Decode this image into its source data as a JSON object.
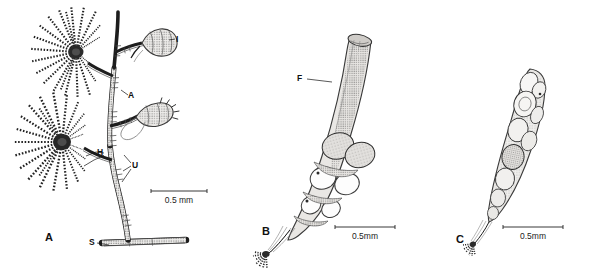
{
  "figure": {
    "background_color": "#ffffff",
    "ink_color": "#1d1d1d"
  },
  "panels": [
    {
      "id": "A",
      "letter": "A",
      "subject": "whole hydroid colony with hydranths, gonothecae and stolon",
      "labels": [
        {
          "key": "I",
          "text": "I",
          "meaning": "upper gonotheca"
        },
        {
          "key": "A",
          "text": "A",
          "meaning": "annulated pedicel"
        },
        {
          "key": "H",
          "text": "H",
          "meaning": "hydranth"
        },
        {
          "key": "U",
          "text": "U",
          "meaning": "hydrotheca / cup"
        },
        {
          "key": "S",
          "text": "S",
          "meaning": "stolon"
        }
      ],
      "scalebar": {
        "text": "0.5 mm"
      }
    },
    {
      "id": "B",
      "letter": "B",
      "subject": "gonotheca containing gonophores",
      "labels": [
        {
          "key": "F",
          "text": "F",
          "meaning": "gonotheca wall"
        }
      ],
      "scalebar": {
        "text": "0.5mm"
      }
    },
    {
      "id": "C",
      "letter": "C",
      "subject": "slender gonotheca with developing gonophores",
      "labels": [],
      "scalebar": {
        "text": "0.5mm"
      }
    }
  ]
}
